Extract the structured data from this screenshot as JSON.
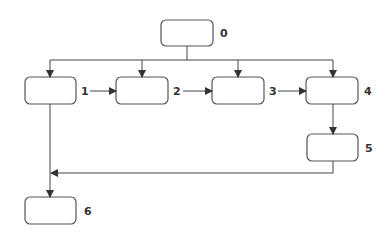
{
  "diagram": {
    "type": "flowchart",
    "nodes": [
      {
        "id": "0",
        "label": "0",
        "text": ""
      },
      {
        "id": "1",
        "label": "1",
        "text": ""
      },
      {
        "id": "2",
        "label": "2",
        "text": ""
      },
      {
        "id": "3",
        "label": "3",
        "text": ""
      },
      {
        "id": "4",
        "label": "4",
        "text": ""
      },
      {
        "id": "5",
        "label": "5",
        "text": ""
      },
      {
        "id": "6",
        "label": "6",
        "text": ""
      }
    ],
    "edges": [
      {
        "from": "0",
        "to": "1"
      },
      {
        "from": "0",
        "to": "2"
      },
      {
        "from": "0",
        "to": "3"
      },
      {
        "from": "0",
        "to": "4"
      },
      {
        "from": "1",
        "to": "2"
      },
      {
        "from": "2",
        "to": "3"
      },
      {
        "from": "3",
        "to": "4"
      },
      {
        "from": "4",
        "to": "5"
      },
      {
        "from": "5",
        "to": "6"
      },
      {
        "from": "1",
        "to": "6"
      }
    ],
    "colors": {
      "stroke": "#444444",
      "background": "#ffffff"
    }
  }
}
